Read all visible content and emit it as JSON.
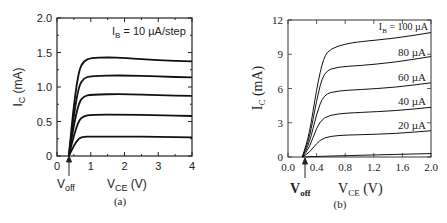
{
  "chart_data": [
    {
      "type": "line",
      "panel_label": "(a)",
      "title": "",
      "xlabel": "V_CE (V)",
      "ylabel": "I_C (mA)",
      "xlim": [
        0,
        4
      ],
      "ylim": [
        0,
        2.0
      ],
      "xticks": [
        "0",
        "1",
        "2",
        "3",
        "4"
      ],
      "yticks": [
        "0",
        "0.5",
        "1.0",
        "1.5",
        "2.0"
      ],
      "annotation": "I_B = 10 µA/step",
      "voff_label": "V_off",
      "voff_x": 0.35,
      "grid": false,
      "series": [
        {
          "name": "I_B step 1",
          "x": [
            0.35,
            0.5,
            0.65,
            0.8,
            1.0,
            2.0,
            3.0,
            4.0
          ],
          "y": [
            0,
            0.15,
            0.26,
            0.28,
            0.28,
            0.28,
            0.28,
            0.27
          ]
        },
        {
          "name": "I_B step 2",
          "x": [
            0.35,
            0.5,
            0.65,
            0.8,
            1.0,
            2.0,
            3.0,
            4.0
          ],
          "y": [
            0,
            0.3,
            0.52,
            0.58,
            0.6,
            0.6,
            0.59,
            0.58
          ]
        },
        {
          "name": "I_B step 3",
          "x": [
            0.35,
            0.5,
            0.65,
            0.8,
            1.0,
            2.0,
            3.0,
            4.0
          ],
          "y": [
            0,
            0.45,
            0.78,
            0.87,
            0.89,
            0.9,
            0.88,
            0.87
          ]
        },
        {
          "name": "I_B step 4",
          "x": [
            0.35,
            0.5,
            0.65,
            0.8,
            1.0,
            2.0,
            3.0,
            4.0
          ],
          "y": [
            0,
            0.6,
            1.02,
            1.13,
            1.16,
            1.17,
            1.15,
            1.14
          ]
        },
        {
          "name": "I_B step 5",
          "x": [
            0.35,
            0.5,
            0.65,
            0.8,
            1.0,
            1.5,
            2.0,
            3.0,
            4.0
          ],
          "y": [
            0,
            0.75,
            1.25,
            1.38,
            1.42,
            1.43,
            1.42,
            1.39,
            1.37
          ]
        }
      ]
    },
    {
      "type": "line",
      "panel_label": "(b)",
      "title": "",
      "xlabel": "V_CE (V)",
      "ylabel": "I_C (mA)",
      "xlim": [
        0,
        2.0
      ],
      "ylim": [
        0,
        12
      ],
      "xticks": [
        "0.0",
        "0.4",
        "0.8",
        "1.2",
        "1.6",
        "2.0"
      ],
      "yticks": [
        "0",
        "3",
        "6",
        "9",
        "12"
      ],
      "voff_label": "V_off",
      "voff_x": 0.25,
      "grid": false,
      "series": [
        {
          "name": "I_B = 0",
          "label": "",
          "x": [
            0.2,
            0.4,
            1.0,
            2.0
          ],
          "y": [
            0,
            0.05,
            0.15,
            0.3
          ]
        },
        {
          "name": "I_B = 20 µA",
          "label": "20 µA",
          "x": [
            0.2,
            0.3,
            0.4,
            0.5,
            0.7,
            1.0,
            1.5,
            2.0
          ],
          "y": [
            0,
            0.4,
            1.2,
            1.7,
            1.9,
            1.95,
            2.05,
            2.3
          ]
        },
        {
          "name": "I_B = 40 µA",
          "label": "40 µA",
          "x": [
            0.2,
            0.3,
            0.4,
            0.5,
            0.7,
            1.0,
            1.5,
            2.0
          ],
          "y": [
            0,
            0.8,
            2.6,
            3.5,
            3.8,
            3.9,
            4.05,
            4.35
          ]
        },
        {
          "name": "I_B = 60 µA",
          "label": "60 µA",
          "x": [
            0.2,
            0.3,
            0.4,
            0.5,
            0.7,
            1.0,
            1.5,
            2.0
          ],
          "y": [
            0,
            1.2,
            3.8,
            5.5,
            5.8,
            5.9,
            6.1,
            6.5
          ]
        },
        {
          "name": "I_B = 80 µA",
          "label": "80 µA",
          "x": [
            0.2,
            0.3,
            0.4,
            0.5,
            0.7,
            1.0,
            1.5,
            2.0
          ],
          "y": [
            0,
            1.6,
            5.0,
            7.5,
            7.9,
            8.0,
            8.3,
            8.8
          ]
        },
        {
          "name": "I_B = 100 µA",
          "label": "I_B = 100 µA",
          "x": [
            0.2,
            0.3,
            0.4,
            0.5,
            0.6,
            0.8,
            1.0,
            1.5,
            2.0
          ],
          "y": [
            0,
            2.0,
            6.0,
            8.8,
            9.5,
            9.9,
            10.1,
            10.4,
            10.9
          ]
        }
      ]
    }
  ],
  "panels": {
    "a": {
      "caption": "(a)",
      "ylabel_main": "I",
      "ylabel_sub": "C",
      "ylabel_unit": " (mA)",
      "xlabel_main": "V",
      "xlabel_sub": "CE",
      "xlabel_unit": " (V)",
      "voff_main": "V",
      "voff_sub": "off",
      "annot_main": "I",
      "annot_sub": "B",
      "annot_rest": " = 10 µA/step"
    },
    "b": {
      "caption": "(b)",
      "ylabel_main": "I",
      "ylabel_sub": "C",
      "ylabel_unit": " (mA)",
      "xlabel_main": "V",
      "xlabel_sub": "CE",
      "xlabel_unit": " (V)",
      "voff_main": "V",
      "voff_sub": "off",
      "label_100_main": "I",
      "label_100_sub": "B",
      "label_100_rest": " = 100 µA",
      "label_80": "80 µA",
      "label_60": "60 µA",
      "label_40": "40 µA",
      "label_20": "20 µA"
    }
  }
}
